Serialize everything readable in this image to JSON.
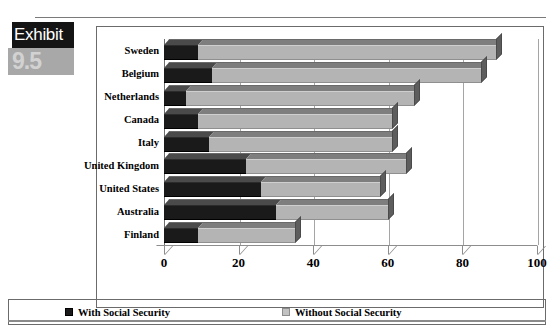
{
  "exhibit": {
    "label": "Exhibit",
    "number": "9.5"
  },
  "legend": {
    "items": [
      {
        "label": "With Social Security",
        "swatch": "black-square-icon",
        "color": "#1a1a1a"
      },
      {
        "label": "Without Social Security",
        "swatch": "gray-square-icon",
        "color": "#c2c2c2"
      }
    ]
  },
  "chart_data": {
    "type": "bar",
    "orientation": "horizontal",
    "stacked": true,
    "title": "",
    "subtitle": "",
    "xlabel": "",
    "ylabel": "",
    "xlim": [
      0,
      100
    ],
    "xticks": [
      0,
      20,
      40,
      60,
      80,
      100
    ],
    "xticklabels": [
      "0",
      "20",
      "40",
      "60",
      "80",
      "100"
    ],
    "grid": true,
    "grid_axis": "x",
    "legend_position": "bottom",
    "categories": [
      "Sweden",
      "Belgium",
      "Netherlands",
      "Canada",
      "Italy",
      "United Kingdom",
      "United States",
      "Australia",
      "Finland"
    ],
    "series": [
      {
        "name": "With Social Security",
        "color": "#1a1a1a",
        "values": [
          9,
          13,
          6,
          9,
          12,
          22,
          26,
          30,
          9
        ]
      },
      {
        "name": "Without Social Security",
        "color": "#b4b4b4",
        "values": [
          80,
          72,
          61,
          52,
          49,
          43,
          32,
          30,
          26
        ]
      }
    ],
    "totals": [
      89,
      85,
      67,
      61,
      61,
      65,
      58,
      60,
      35
    ]
  }
}
